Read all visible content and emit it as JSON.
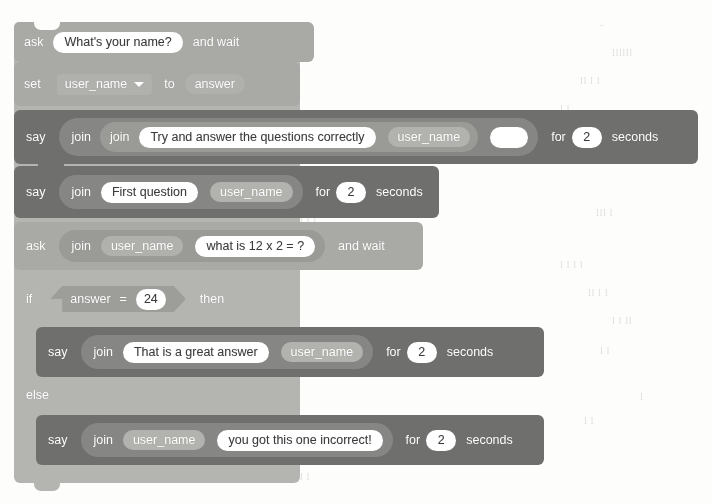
{
  "app": {
    "title": "Scratch block script",
    "description": "Scratch 3.0 block stack: ask name, set variable, say greetings, ask a question, if/else on the answer"
  },
  "palette": {
    "sensing": "#a9a9a6",
    "variables": "#a9a9a6",
    "looks": "#6f6f6d",
    "control": "#b4b4b0",
    "operators": "#9d9d9a",
    "input_field": "#ffffff",
    "input_text": "#3b3b3b",
    "block_text": "#ffffff",
    "page_background": "#fdfdfc"
  },
  "script": {
    "blocks": [
      {
        "id": "ask-name",
        "type": "sensing",
        "words": {
          "ask": "ask",
          "and_wait": "and wait"
        },
        "question": "What's your name?"
      },
      {
        "id": "set-user-name",
        "type": "variables",
        "words": {
          "set": "set",
          "to": "to"
        },
        "variable": "user_name",
        "value": "answer"
      },
      {
        "id": "say-intro",
        "type": "looks",
        "words": {
          "say": "say",
          "join": "join",
          "for": "for",
          "seconds": "seconds"
        },
        "text1": "Try and answer the questions correctly",
        "text2": "user_name",
        "text3": "",
        "duration": "2"
      },
      {
        "id": "say-first-question",
        "type": "looks",
        "words": {
          "say": "say",
          "join": "join",
          "for": "for",
          "seconds": "seconds"
        },
        "text1": "First question",
        "text2": "user_name",
        "duration": "2"
      },
      {
        "id": "ask-maths",
        "type": "sensing",
        "words": {
          "ask": "ask",
          "join": "join",
          "and_wait": "and wait"
        },
        "text1": "user_name",
        "text2": "what is 12 x 2 = ?"
      },
      {
        "id": "if-else",
        "type": "control",
        "words": {
          "if": "if",
          "then": "then",
          "else": "else"
        },
        "condition": {
          "left": "answer",
          "operator": "=",
          "right": "24"
        },
        "then_branch": {
          "id": "say-correct",
          "type": "looks",
          "words": {
            "say": "say",
            "join": "join",
            "for": "for",
            "seconds": "seconds"
          },
          "text1": "That is a great answer",
          "text2": "user_name",
          "duration": "2"
        },
        "else_branch": {
          "id": "say-incorrect",
          "type": "looks",
          "words": {
            "say": "say",
            "join": "join",
            "for": "for",
            "seconds": "seconds"
          },
          "text1": "user_name",
          "text2": "you got this one incorrect!",
          "duration": "2"
        }
      }
    ]
  },
  "bleed_text": {
    "lines": [
      "rate",
      "that",
      "code",
      "the",
      "name",
      "Hello",
      "There",
      "part",
      "value",
      "input"
    ]
  }
}
